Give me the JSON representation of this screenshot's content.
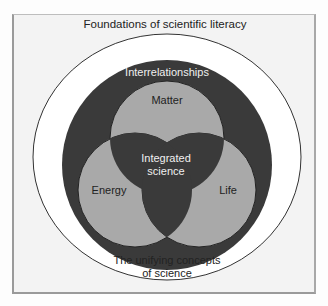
{
  "diagram": {
    "outer_label": "Foundations of scientific literacy",
    "ring_label": "Interrelationships",
    "center_label_line1": "Integrated",
    "center_label_line2": "science",
    "circles": [
      {
        "label": "Matter"
      },
      {
        "label": "Energy"
      },
      {
        "label": "Life"
      }
    ],
    "bottom_label_line1": "The unifying concepts",
    "bottom_label_line2": "of science"
  },
  "colors": {
    "frame_bg": "#f3f3f3",
    "white_ellipse": "#ffffff",
    "dark_ring": "#3a3a3a",
    "venn_fill": "#a9a9a9",
    "text_dark": "#222222",
    "text_light": "#f0f0f0"
  }
}
